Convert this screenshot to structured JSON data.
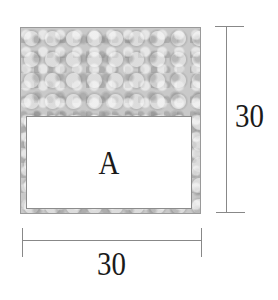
{
  "figure": {
    "shape": "square",
    "region_label": "A",
    "dimensions": {
      "width": "30",
      "height": "30"
    },
    "shaded_region": "top strip and borders (textured gray)",
    "unshaded_region_label": "A"
  }
}
